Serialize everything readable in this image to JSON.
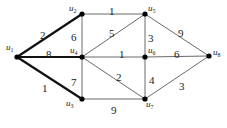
{
  "diagram": {
    "type": "weighted-graph",
    "nodes": [
      {
        "id": "u1",
        "label": "u",
        "sub": "1",
        "x": 17,
        "y": 57,
        "lx": 6,
        "ly": 50
      },
      {
        "id": "u2",
        "label": "u",
        "sub": "2",
        "x": 82,
        "y": 14,
        "lx": 69,
        "ly": 11
      },
      {
        "id": "u5",
        "label": "u",
        "sub": "5",
        "x": 145,
        "y": 14,
        "lx": 148,
        "ly": 11
      },
      {
        "id": "u4",
        "label": "u",
        "sub": "4",
        "x": 82,
        "y": 57,
        "lx": 70,
        "ly": 53
      },
      {
        "id": "u6",
        "label": "u",
        "sub": "6",
        "x": 145,
        "y": 57,
        "lx": 148,
        "ly": 53
      },
      {
        "id": "u8",
        "label": "u",
        "sub": "8",
        "x": 209,
        "y": 56,
        "lx": 213,
        "ly": 55
      },
      {
        "id": "u3",
        "label": "u",
        "sub": "3",
        "x": 82,
        "y": 99,
        "lx": 66,
        "ly": 106
      },
      {
        "id": "u7",
        "label": "u",
        "sub": "7",
        "x": 145,
        "y": 99,
        "lx": 146,
        "ly": 107
      }
    ],
    "edges": [
      {
        "from": "u1",
        "to": "u2",
        "weight": "2",
        "bold": true,
        "wx": 40,
        "wy": 35
      },
      {
        "from": "u1",
        "to": "u4",
        "weight": "8",
        "bold": true,
        "wx": 46,
        "wy": 54
      },
      {
        "from": "u1",
        "to": "u3",
        "weight": "1",
        "bold": true,
        "wx": 42,
        "wy": 88
      },
      {
        "from": "u2",
        "to": "u5",
        "weight": "1",
        "bold": false,
        "wx": 109,
        "wy": 11
      },
      {
        "from": "u2",
        "to": "u4",
        "weight": "6",
        "bold": false,
        "wx": 71,
        "wy": 37
      },
      {
        "from": "u4",
        "to": "u5",
        "weight": "5",
        "bold": false,
        "wx": 109,
        "wy": 33
      },
      {
        "from": "u4",
        "to": "u6",
        "weight": "1",
        "bold": false,
        "wx": 119,
        "wy": 54
      },
      {
        "from": "u4",
        "to": "u3",
        "weight": "7",
        "bold": false,
        "wx": 71,
        "wy": 82
      },
      {
        "from": "u4",
        "to": "u7",
        "weight": "2",
        "bold": false,
        "wx": 116,
        "wy": 77
      },
      {
        "from": "u3",
        "to": "u7",
        "weight": "9",
        "bold": false,
        "wx": 111,
        "wy": 110
      },
      {
        "from": "u5",
        "to": "u6",
        "weight": "3",
        "bold": false,
        "wx": 148,
        "wy": 38
      },
      {
        "from": "u5",
        "to": "u8",
        "weight": "9",
        "bold": false,
        "wx": 178,
        "wy": 33
      },
      {
        "from": "u6",
        "to": "u8",
        "weight": "6",
        "bold": false,
        "wx": 174,
        "wy": 54
      },
      {
        "from": "u6",
        "to": "u7",
        "weight": "4",
        "bold": false,
        "wx": 149,
        "wy": 80
      },
      {
        "from": "u7",
        "to": "u8",
        "weight": "3",
        "bold": false,
        "wx": 179,
        "wy": 86
      }
    ]
  }
}
